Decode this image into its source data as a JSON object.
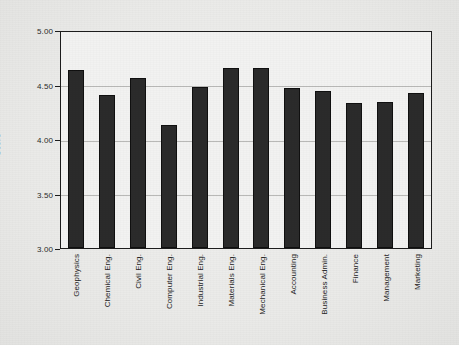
{
  "chart_data": {
    "type": "bar",
    "title": "",
    "xlabel": "",
    "ylabel": "Score",
    "ylim": [
      3.0,
      5.0
    ],
    "ytick_labels": [
      "5.00",
      "4.50",
      "4.00",
      "3.50",
      "3.00"
    ],
    "ytick_values": [
      5.0,
      4.5,
      4.0,
      3.5,
      3.0
    ],
    "grid": true,
    "legend": "none",
    "bar_color": "#2b2b2b",
    "background_color": "#f2f2f1",
    "axis_color": "#1d1d1d",
    "gridline_color": "#b9b9b7",
    "categories": [
      "Geophysics",
      "Chemical Eng.",
      "Civil Eng.",
      "Computer Eng.",
      "Industrial Eng.",
      "Materials  Eng.",
      "Mechanical Eng.",
      "Accounting",
      "Business Admin.",
      "Finance",
      "Management",
      "Marketing"
    ],
    "values": [
      4.63,
      4.4,
      4.56,
      4.13,
      4.48,
      4.65,
      4.65,
      4.47,
      4.44,
      4.33,
      4.34,
      4.42
    ]
  }
}
